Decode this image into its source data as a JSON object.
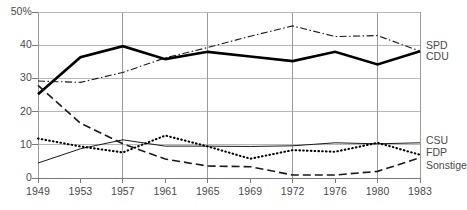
{
  "chart_data": {
    "type": "line",
    "title": "",
    "subtitle": "",
    "xlabel": "",
    "ylabel": "",
    "x": [
      1949,
      1953,
      1957,
      1961,
      1965,
      1969,
      1972,
      1976,
      1980,
      1983
    ],
    "x_tick_labels": [
      "1949",
      "1953",
      "1957",
      "1961",
      "1965",
      "1969",
      "1972",
      "1976",
      "1980",
      "1983"
    ],
    "y_ticks": [
      0,
      10,
      20,
      30,
      40,
      50
    ],
    "y_tick_labels": [
      "0",
      "10",
      "20",
      "30",
      "40",
      "50%"
    ],
    "ylim": [
      0,
      50
    ],
    "grid": true,
    "grid_axis": "both",
    "legend_position": "right-inline",
    "series": [
      {
        "name": "SPD",
        "style": "dash-dot",
        "color": "#1a1a1a",
        "width": 1.1,
        "values": [
          29.2,
          28.8,
          31.8,
          36.2,
          39.3,
          42.7,
          45.8,
          42.6,
          42.9,
          38.2
        ]
      },
      {
        "name": "CDU",
        "style": "solid-bold",
        "color": "#000000",
        "width": 2.6,
        "values": [
          25.2,
          36.4,
          39.7,
          35.8,
          38.0,
          36.6,
          35.2,
          38.0,
          34.2,
          38.2
        ]
      },
      {
        "name": "CSU",
        "style": "solid-thin",
        "color": "#1a1a1a",
        "width": 1.0,
        "values": [
          4.5,
          8.8,
          11.5,
          9.6,
          9.6,
          9.5,
          9.7,
          10.6,
          10.3,
          10.6
        ]
      },
      {
        "name": "FDP",
        "style": "dotted",
        "color": "#000000",
        "width": 2.1,
        "values": [
          11.9,
          9.5,
          7.7,
          12.8,
          9.5,
          5.8,
          8.4,
          7.9,
          10.6,
          7.0
        ]
      },
      {
        "name": "Sonstige",
        "style": "long-dash",
        "color": "#1a1a1a",
        "width": 1.6,
        "values": [
          27.9,
          16.5,
          10.3,
          5.7,
          3.6,
          3.4,
          0.9,
          0.9,
          2.0,
          6.1
        ]
      }
    ],
    "legend": [
      {
        "label": "SPD",
        "value_at_end": 38.2
      },
      {
        "label": "CDU",
        "value_at_end": 38.2
      },
      {
        "label": "CSU",
        "value_at_end": 10.6
      },
      {
        "label": "FDP",
        "value_at_end": 7.0
      },
      {
        "label": "Sonstige",
        "value_at_end": 6.1
      }
    ]
  },
  "axes": {
    "left": 38,
    "right": 420,
    "top": 12,
    "bottom": 178
  }
}
